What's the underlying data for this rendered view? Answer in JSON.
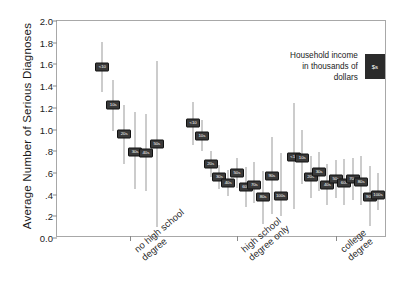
{
  "chart_data": {
    "type": "scatter",
    "title": "",
    "xlabel": "",
    "ylabel": "Average Number of Serious Diagnoses",
    "ylim": [
      0.0,
      2.0
    ],
    "ytick_labels": [
      "2.0",
      "1.8",
      "1.6",
      "1.4",
      "1.2",
      "1.0",
      ".8",
      ".6",
      ".4",
      ".2",
      "0.0"
    ],
    "ytick_values": [
      2.0,
      1.8,
      1.6,
      1.4,
      1.2,
      1.0,
      0.8,
      0.6,
      0.4,
      0.2,
      0.0
    ],
    "grid": false,
    "legend_position": "top-right",
    "error_bar_note": "vertical lines are confidence intervals",
    "categories": [
      "no high school\ndegree",
      "high school\ndegree only",
      "college degree"
    ],
    "series": [
      {
        "name": "no high school degree",
        "points": [
          {
            "label": "<10",
            "value": 1.58,
            "low": 1.35,
            "high": 1.81
          },
          {
            "label": "10s",
            "value": 1.23,
            "low": 0.99,
            "high": 1.46
          },
          {
            "label": "20s",
            "value": 0.96,
            "low": 0.68,
            "high": 1.23
          },
          {
            "label": "30s",
            "value": 0.79,
            "low": 0.45,
            "high": 1.16
          },
          {
            "label": "40s",
            "value": 0.78,
            "low": 0.43,
            "high": 1.14
          },
          {
            "label": "50s",
            "value": 0.87,
            "low": 0.1,
            "high": 1.63
          }
        ]
      },
      {
        "name": "high school degree only",
        "points": [
          {
            "label": "<10",
            "value": 1.06,
            "low": 0.86,
            "high": 1.25
          },
          {
            "label": "10s",
            "value": 0.94,
            "low": 0.8,
            "high": 1.09
          },
          {
            "label": "20s",
            "value": 0.68,
            "low": 0.56,
            "high": 0.8
          },
          {
            "label": "30s",
            "value": 0.56,
            "low": 0.45,
            "high": 0.67
          },
          {
            "label": "40s",
            "value": 0.51,
            "low": 0.39,
            "high": 0.63
          },
          {
            "label": "50s",
            "value": 0.6,
            "low": 0.46,
            "high": 0.74
          },
          {
            "label": "60s",
            "value": 0.47,
            "low": 0.29,
            "high": 0.65
          },
          {
            "label": "70s",
            "value": 0.49,
            "low": 0.32,
            "high": 0.7
          },
          {
            "label": "80s",
            "value": 0.38,
            "low": 0.13,
            "high": 0.62
          },
          {
            "label": "90s",
            "value": 0.57,
            "low": 0.22,
            "high": 0.93
          },
          {
            "label": "100s",
            "value": 0.39,
            "low": 0.2,
            "high": 0.78
          }
        ]
      },
      {
        "name": "college degree",
        "points": [
          {
            "label": "<10",
            "value": 0.75,
            "low": 0.27,
            "high": 1.24
          },
          {
            "label": "10s",
            "value": 0.74,
            "low": 0.5,
            "high": 1.0
          },
          {
            "label": "20s",
            "value": 0.56,
            "low": 0.37,
            "high": 0.76
          },
          {
            "label": "30s",
            "value": 0.61,
            "low": 0.43,
            "high": 0.79
          },
          {
            "label": "40s",
            "value": 0.49,
            "low": 0.3,
            "high": 0.68
          },
          {
            "label": "50s",
            "value": 0.54,
            "low": 0.37,
            "high": 0.72
          },
          {
            "label": "60s",
            "value": 0.51,
            "low": 0.3,
            "high": 0.73
          },
          {
            "label": "70s",
            "value": 0.54,
            "low": 0.35,
            "high": 0.74
          },
          {
            "label": "80s",
            "value": 0.52,
            "low": 0.3,
            "high": 0.76
          },
          {
            "label": "90s",
            "value": 0.38,
            "low": 0.11,
            "high": 0.66
          },
          {
            "label": "100s",
            "value": 0.4,
            "low": 0.26,
            "high": 0.6
          }
        ]
      }
    ]
  },
  "legend": {
    "text": "Household income\nin thousands of dollars",
    "swatch_label": "$s"
  }
}
